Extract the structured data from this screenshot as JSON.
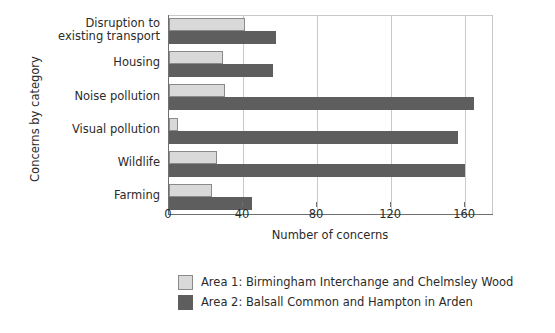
{
  "chart_data": {
    "type": "bar",
    "orientation": "horizontal",
    "title": "",
    "xlabel": "Number of concerns",
    "ylabel": "Concerns by category",
    "xlim": [
      0,
      175
    ],
    "xticks": [
      0,
      40,
      80,
      120,
      160
    ],
    "grid": true,
    "legend_position": "bottom",
    "categories": [
      "Disruption to\nexisting transport",
      "Housing",
      "Noise pollution",
      "Visual pollution",
      "Wildlife",
      "Farming"
    ],
    "category_lines": [
      [
        "Disruption to",
        "existing transport"
      ],
      [
        "Housing"
      ],
      [
        "Noise pollution"
      ],
      [
        "Visual pollution"
      ],
      [
        "Wildlife"
      ],
      [
        "Farming"
      ]
    ],
    "series": [
      {
        "name": "Area 1: Birmingham Interchange and Chelmsley Wood",
        "color": "#d9d9d9",
        "edge_color": "#8a8a8a",
        "values": [
          41,
          29,
          30,
          5,
          26,
          23
        ]
      },
      {
        "name": "Area 2: Balsall Common and Hampton in Arden",
        "color": "#5e5e5e",
        "edge_color": "#5e5e5e",
        "values": [
          58,
          56,
          165,
          156,
          160,
          45
        ]
      }
    ]
  },
  "axes": {
    "x_tick_labels": [
      "0",
      "40",
      "80",
      "120",
      "160"
    ],
    "x_title": "Number of concerns",
    "y_title": "Concerns by category"
  },
  "legend": {
    "items": [
      "Area 1: Birmingham Interchange and Chelmsley Wood",
      "Area 2: Balsall Common and Hampton in Arden"
    ]
  }
}
